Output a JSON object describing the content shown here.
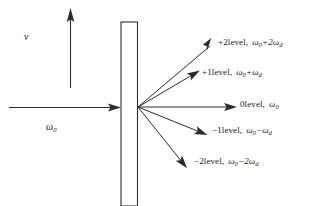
{
  "figure": {
    "name": "diffraction-frequency-shift-diagram",
    "axes": {
      "vertical_axis_label": "v",
      "incident_beam_label": "ω",
      "incident_beam_sub": "0"
    },
    "barrier": {
      "name": "grating-barrier"
    },
    "orders": [
      {
        "id": "plus-2",
        "level_text": "+2level,",
        "freq_main": "ω",
        "freq_sub": "0",
        "freq_rest": "+2ω",
        "freq_rest_sub": "d",
        "full_text": "+2level,  ω0+2ωd"
      },
      {
        "id": "plus-1",
        "level_text": "+1level,",
        "freq_main": "ω",
        "freq_sub": "0",
        "freq_rest": "+ω",
        "freq_rest_sub": "d",
        "full_text": "+1level,  ω0+ωd"
      },
      {
        "id": "zero",
        "level_text": "0level,",
        "freq_main": "ω",
        "freq_sub": "0",
        "freq_rest": "",
        "freq_rest_sub": "",
        "full_text": "0level,  ω0"
      },
      {
        "id": "minus-1",
        "level_text": "−1level,",
        "freq_main": "ω",
        "freq_sub": "0",
        "freq_rest": "−ω",
        "freq_rest_sub": "d",
        "full_text": "−1level,  ω0−ωd"
      },
      {
        "id": "minus-2",
        "level_text": "−2level,",
        "freq_main": "ω",
        "freq_sub": "0",
        "freq_rest": "−2ω",
        "freq_rest_sub": "d",
        "full_text": "−2level,  ω0−2ωd"
      }
    ],
    "colors": {
      "ink": "#2b2b2b",
      "background": "#ffffff"
    }
  }
}
